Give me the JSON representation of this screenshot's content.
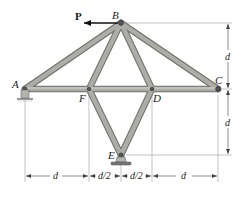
{
  "figure": {
    "type": "truss",
    "joints": {
      "A": {
        "label": "A",
        "x": 25,
        "y": 89,
        "support": "pin"
      },
      "B": {
        "label": "B",
        "x": 121,
        "y": 23
      },
      "C": {
        "label": "C",
        "x": 218,
        "y": 89
      },
      "D": {
        "label": "D",
        "x": 152,
        "y": 89
      },
      "E": {
        "label": "E",
        "x": 121,
        "y": 155,
        "support": "pin"
      },
      "F": {
        "label": "F",
        "x": 89,
        "y": 89
      }
    },
    "members": [
      [
        "A",
        "B"
      ],
      [
        "B",
        "C"
      ],
      [
        "A",
        "F"
      ],
      [
        "F",
        "D"
      ],
      [
        "D",
        "C"
      ],
      [
        "B",
        "F"
      ],
      [
        "B",
        "D"
      ],
      [
        "F",
        "E"
      ],
      [
        "D",
        "E"
      ]
    ],
    "load": {
      "label": "P",
      "joint": "B",
      "direction": "left"
    },
    "dimensions": {
      "horizontal": [
        "d",
        "d/2",
        "d/2",
        "d"
      ],
      "vertical": [
        "d",
        "d"
      ]
    },
    "colors": {
      "member_fill": "#a9a9a5",
      "member_edge": "#6e6e6a",
      "line": "#333333",
      "dim_line": "#888888"
    }
  }
}
